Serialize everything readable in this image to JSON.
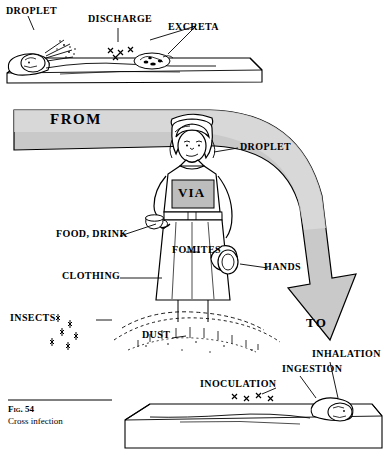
{
  "figure": {
    "number": "Fig. 54",
    "title": "Cross infection",
    "alt": "Diagram of routes of cross infection from a patient in bed, via a nurse, to another patient in bed"
  },
  "labels": {
    "droplet_top": "DROPLET",
    "discharge": "DISCHARGE",
    "excreta": "EXCRETA",
    "from": "FROM",
    "droplet_nurse": "DROPLET",
    "via": "VIA",
    "food_drink": "FOOD, DRINK",
    "fomites": "FOMITES",
    "clothing": "CLOTHING",
    "hands": "HANDS",
    "insects": "INSECTS",
    "dust": "DUST",
    "to": "TO",
    "inhalation": "INHALATION",
    "ingestion": "INGESTION",
    "inoculation": "INOCULATION"
  },
  "colors": {
    "ink": "#000000",
    "paper": "#ffffff",
    "shade_light": "#d8d8d8",
    "shade_mid": "#b9b9b9",
    "shade_dark": "#9a9a9a"
  }
}
